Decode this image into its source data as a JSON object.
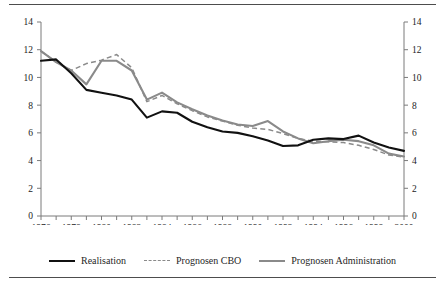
{
  "chart_data": {
    "type": "line",
    "title": "",
    "subtitle": "",
    "xlabel": "",
    "ylabel": "",
    "xlim": [
      1976,
      2000
    ],
    "ylim": [
      0,
      14
    ],
    "yticks": [
      0,
      2,
      4,
      6,
      8,
      10,
      12,
      14
    ],
    "ytick_labels": [
      "0",
      "2",
      "4",
      "6",
      "8",
      "10",
      "12",
      "14"
    ],
    "right_axis_ticks": [
      0,
      2,
      4,
      6,
      8,
      10,
      12,
      14
    ],
    "right_axis_labels": [
      "0",
      "2",
      "4",
      "6",
      "8",
      "10",
      "12",
      "14"
    ],
    "x": [
      1976,
      1977,
      1978,
      1979,
      1980,
      1981,
      1982,
      1983,
      1984,
      1985,
      1986,
      1987,
      1988,
      1989,
      1990,
      1991,
      1992,
      1993,
      1994,
      1995,
      1996,
      1997,
      1998,
      1999,
      2000
    ],
    "xticks": [
      1976,
      1977,
      1978,
      1979,
      1980,
      1981,
      1982,
      1983,
      1984,
      1985,
      1986,
      1987,
      1988,
      1989,
      1990,
      1991,
      1992,
      1993,
      1994,
      1995,
      1996,
      1997,
      1998,
      1999,
      2000
    ],
    "xtick_labels_shown": [
      "1976",
      "1978",
      "1980",
      "1982",
      "1984",
      "1986",
      "1988",
      "1990",
      "1992",
      "1994",
      "1996",
      "1998",
      "2000"
    ],
    "xtick_label_interval": 2,
    "grid": false,
    "legend_position": "bottom-center",
    "series": [
      {
        "name": "Realisation",
        "style": "solid",
        "color": "#111111",
        "width": 2.1,
        "values": [
          11.2,
          11.3,
          10.3,
          9.1,
          8.9,
          8.7,
          8.4,
          7.1,
          7.55,
          7.45,
          6.8,
          6.4,
          6.1,
          6.0,
          5.75,
          5.45,
          5.05,
          5.1,
          5.5,
          5.6,
          5.55,
          5.8,
          5.3,
          4.95,
          4.7
        ]
      },
      {
        "name": "Prognosen CBO",
        "style": "dashed",
        "color": "#8a8a8a",
        "width": 1.5,
        "values": [
          11.9,
          11.1,
          10.5,
          11.0,
          11.25,
          11.65,
          10.7,
          8.25,
          8.7,
          8.1,
          7.6,
          7.15,
          6.85,
          6.55,
          6.35,
          6.25,
          5.95,
          5.6,
          5.4,
          5.35,
          5.3,
          5.1,
          4.8,
          4.4,
          4.25
        ]
      },
      {
        "name": "Prognosen Administration",
        "style": "solid",
        "color": "#8a8a8a",
        "width": 2.1,
        "values": [
          11.9,
          11.1,
          10.5,
          9.5,
          11.2,
          11.2,
          10.5,
          8.4,
          8.9,
          8.2,
          7.7,
          7.25,
          6.9,
          6.6,
          6.5,
          6.85,
          6.1,
          5.6,
          5.25,
          5.4,
          5.5,
          5.4,
          5.1,
          4.5,
          4.3
        ]
      }
    ]
  },
  "legend": {
    "items": [
      {
        "label": "Realisation",
        "swatch": "solid-black-line"
      },
      {
        "label": "Prognosen CBO",
        "swatch": "dashed-gray-line"
      },
      {
        "label": "Prognosen Administration",
        "swatch": "solid-gray-line"
      }
    ]
  },
  "colors": {
    "realisation": "#111111",
    "forecast_gray": "#8a8a8a",
    "axis": "#7a7a7a",
    "rule": "#4d4d4d",
    "background": "#ffffff"
  }
}
